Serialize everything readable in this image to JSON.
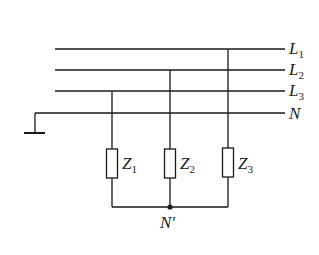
{
  "diagram": {
    "lines": [
      {
        "id": "L1",
        "label": "L",
        "sub": "1"
      },
      {
        "id": "L2",
        "label": "L",
        "sub": "2"
      },
      {
        "id": "L3",
        "label": "L",
        "sub": "3"
      },
      {
        "id": "N",
        "label": "N",
        "sub": ""
      }
    ],
    "loads": [
      {
        "id": "Z1",
        "label": "Z",
        "sub": "1",
        "connected_to": "L3"
      },
      {
        "id": "Z2",
        "label": "Z",
        "sub": "2",
        "connected_to": "L2"
      },
      {
        "id": "Z3",
        "label": "Z",
        "sub": "3",
        "connected_to": "L1"
      }
    ],
    "neutral_point": {
      "label": "N′"
    },
    "ground": {
      "connected_to": "N"
    },
    "colors": {
      "stroke": "#1a1a1a",
      "background": "#ffffff"
    }
  }
}
